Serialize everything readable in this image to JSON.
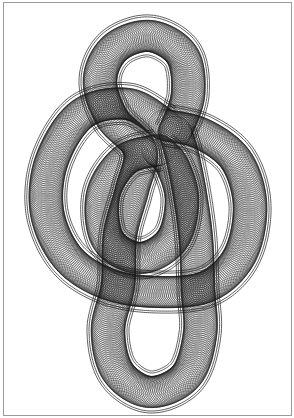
{
  "artwork": {
    "title": "Spirograph knot drawing",
    "stroke_color": "#1a1a1a",
    "background_color": "#ffffff",
    "frame_color": "#9a9a9a",
    "tube": {
      "circle_radius": 17,
      "circle_spacing": 1.9,
      "stroke_width": 0.45,
      "outer_rail_offsets": [
        19,
        21
      ]
    },
    "strands": [
      {
        "name": "strand-top-loop-and-bottom-u",
        "closed": false,
        "points": [
          [
            175,
            132
          ],
          [
            188,
            95
          ],
          [
            182,
            55
          ],
          [
            150,
            36
          ],
          [
            115,
            48
          ],
          [
            100,
            80
          ],
          [
            112,
            118
          ],
          [
            140,
            150
          ],
          [
            132,
            190
          ],
          [
            120,
            235
          ],
          [
            118,
            285
          ],
          [
            108,
            330
          ],
          [
            118,
            372
          ],
          [
            150,
            392
          ],
          [
            186,
            376
          ],
          [
            200,
            334
          ],
          [
            198,
            290
          ],
          [
            196,
            240
          ],
          [
            190,
            195
          ],
          [
            182,
            155
          ],
          [
            175,
            132
          ]
        ]
      },
      {
        "name": "strand-left-arc-and-bar",
        "closed": false,
        "points": [
          [
            165,
            125
          ],
          [
            128,
            104
          ],
          [
            82,
            114
          ],
          [
            52,
            160
          ],
          [
            47,
            212
          ],
          [
            68,
            258
          ],
          [
            108,
            284
          ],
          [
            158,
            292
          ],
          [
            208,
            286
          ],
          [
            240,
            255
          ],
          [
            250,
            205
          ],
          [
            236,
            160
          ],
          [
            202,
            134
          ],
          [
            165,
            125
          ]
        ]
      },
      {
        "name": "strand-inner-loop",
        "closed": false,
        "points": [
          [
            158,
            150
          ],
          [
            125,
            160
          ],
          [
            103,
            195
          ],
          [
            108,
            240
          ],
          [
            140,
            258
          ],
          [
            172,
            240
          ],
          [
            182,
            200
          ],
          [
            172,
            165
          ],
          [
            158,
            150
          ]
        ]
      }
    ]
  }
}
